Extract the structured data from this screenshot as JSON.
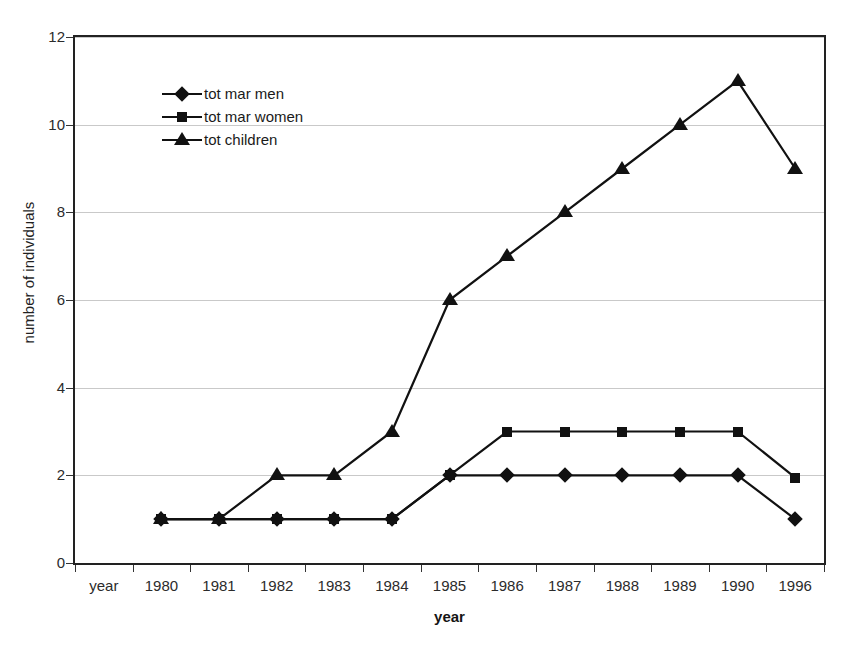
{
  "chart_data": {
    "type": "line",
    "title": "",
    "xlabel": "year",
    "ylabel": "number of individuals",
    "categories": [
      "year",
      "1980",
      "1981",
      "1982",
      "1983",
      "1984",
      "1985",
      "1986",
      "1987",
      "1988",
      "1989",
      "1990",
      "1996"
    ],
    "ylim": [
      0,
      12
    ],
    "ytick_labels": [
      "0",
      "2",
      "4",
      "6",
      "8",
      "10",
      "12"
    ],
    "ytick_values": [
      0,
      2,
      4,
      6,
      8,
      10,
      12
    ],
    "grid": "horizontal",
    "legend_position": "top-left inside plot",
    "series": [
      {
        "name": "tot mar men",
        "marker": "diamond",
        "color": "#111111",
        "values": [
          null,
          1,
          1,
          1,
          1,
          1,
          2,
          2,
          2,
          2,
          2,
          2,
          1
        ]
      },
      {
        "name": "tot mar women",
        "marker": "square",
        "color": "#111111",
        "values": [
          null,
          1,
          1,
          1,
          1,
          1,
          2,
          3,
          3,
          3,
          3,
          3,
          1.95
        ]
      },
      {
        "name": "tot children",
        "marker": "triangle",
        "color": "#111111",
        "values": [
          null,
          1,
          1,
          2,
          2,
          3,
          6,
          7,
          8,
          9,
          10,
          11,
          9
        ]
      }
    ]
  },
  "axes": {
    "y_title": "number of individuals",
    "x_title": "year"
  },
  "legend": {
    "items": [
      {
        "label": "tot mar men",
        "marker": "diamond"
      },
      {
        "label": "tot mar women",
        "marker": "square"
      },
      {
        "label": "tot children",
        "marker": "triangle"
      }
    ]
  }
}
